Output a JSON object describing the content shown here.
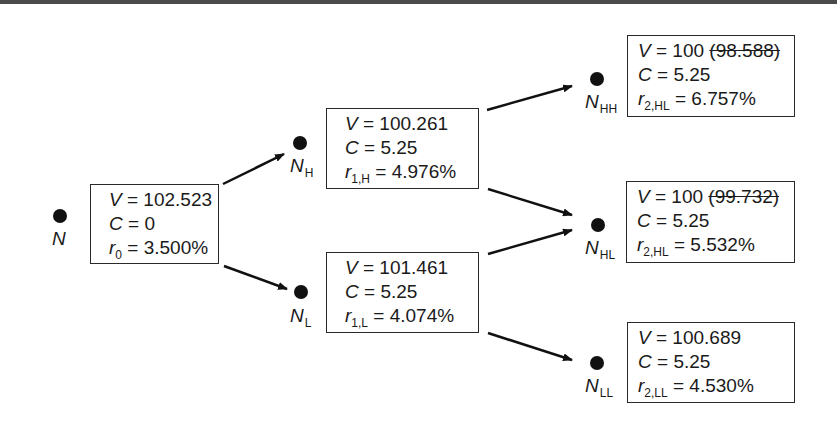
{
  "diagram": {
    "title": "",
    "type": "binomial interest rate tree",
    "nodes": [
      {
        "id": "N",
        "label": "N",
        "sub": "",
        "V": "102.523",
        "V_struck": "",
        "C": "0",
        "r_sym": "r",
        "r_sub": "0",
        "r": "3.500%"
      },
      {
        "id": "NH",
        "label": "N",
        "sub": "H",
        "V": "100.261",
        "V_struck": "",
        "C": "5.25",
        "r_sym": "r",
        "r_sub": "1,H",
        "r": "4.976%"
      },
      {
        "id": "NL",
        "label": "N",
        "sub": "L",
        "V": "101.461",
        "V_struck": "",
        "C": "5.25",
        "r_sym": "r",
        "r_sub": "1,L",
        "r": "4.074%"
      },
      {
        "id": "NHH",
        "label": "N",
        "sub": "HH",
        "V": "100",
        "V_struck": "(98.588)",
        "C": "5.25",
        "r_sym": "r",
        "r_sub": "2,HL",
        "r": "6.757%"
      },
      {
        "id": "NHL",
        "label": "N",
        "sub": "HL",
        "V": "100",
        "V_struck": "(99.732)",
        "C": "5.25",
        "r_sym": "r",
        "r_sub": "2,HL",
        "r": "5.532%"
      },
      {
        "id": "NLL",
        "label": "N",
        "sub": "LL",
        "V": "100.689",
        "V_struck": "",
        "C": "5.25",
        "r_sym": "r",
        "r_sub": "2,LL",
        "r": "4.530%"
      }
    ],
    "edges": [
      {
        "from": "N",
        "to": "NH"
      },
      {
        "from": "N",
        "to": "NL"
      },
      {
        "from": "NH",
        "to": "NHH"
      },
      {
        "from": "NH",
        "to": "NHL"
      },
      {
        "from": "NL",
        "to": "NHL"
      },
      {
        "from": "NL",
        "to": "NLL"
      }
    ],
    "symbols": {
      "V": "V",
      "C": "C",
      "eq": " = "
    }
  }
}
